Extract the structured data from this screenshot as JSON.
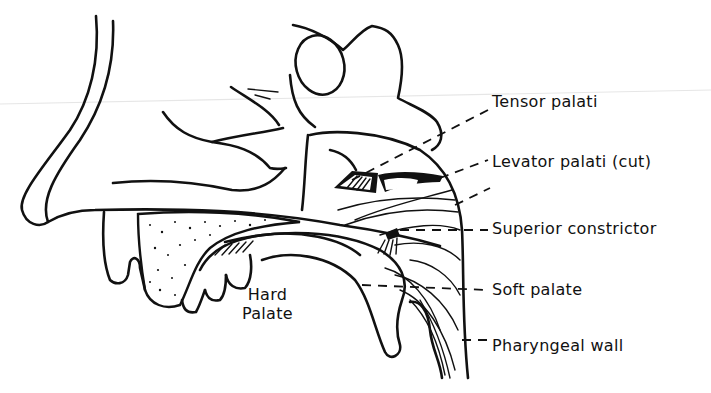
{
  "figure": {
    "labels": [
      {
        "id": "tensor",
        "text": "Tensor palati"
      },
      {
        "id": "levator",
        "text": "Levator palati (cut)"
      },
      {
        "id": "constrictor",
        "text": "Superior constrictor"
      },
      {
        "id": "soft",
        "text": "Soft palate"
      },
      {
        "id": "pharyngeal",
        "text": "Pharyngeal wall"
      }
    ],
    "hard_palate": {
      "line1": "Hard",
      "line2": "Palate"
    }
  }
}
